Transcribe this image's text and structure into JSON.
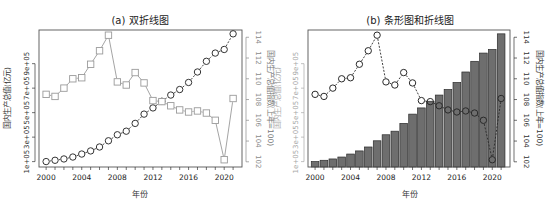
{
  "figure": {
    "width": 552,
    "height": 211,
    "background": "#ffffff"
  },
  "chart_data": [
    {
      "id": "a",
      "type": "line",
      "title": "(a) 双折线图",
      "xlabel": "年份",
      "ylabel_left": "国内生产总值(亿元)",
      "ylabel_right": "国内生产总值指数(上年=100)",
      "x": [
        2000,
        2001,
        2002,
        2003,
        2004,
        2005,
        2006,
        2007,
        2008,
        2009,
        2010,
        2011,
        2012,
        2013,
        2014,
        2015,
        2016,
        2017,
        2018,
        2019,
        2020,
        2021
      ],
      "x_ticks": [
        2000,
        2004,
        2008,
        2012,
        2016,
        2020
      ],
      "xlim": [
        1999.2,
        2022.0
      ],
      "y_left_ticks": [
        100000,
        300000,
        500000,
        700000,
        900000
      ],
      "y_left_tick_labels": [
        "1e+05",
        "3e+05",
        "5e+05",
        "7e+05",
        "9e+05"
      ],
      "y_left_lim": [
        56000,
        1175000
      ],
      "y_right_ticks": [
        102,
        104,
        106,
        108,
        110,
        112,
        114
      ],
      "y_right_lim": [
        101.5,
        114.7
      ],
      "grid": false,
      "series": [
        {
          "name": "国内生产总值(亿元)",
          "axis": "left",
          "marker": "circle",
          "line": "dashed",
          "color": "#333333",
          "values": [
            100280,
            110863,
            121717,
            137422,
            161840,
            187319,
            219438,
            270092,
            319245,
            348518,
            412119,
            487940,
            538580,
            592963,
            643563,
            688858,
            746395,
            832036,
            919281,
            986515,
            1015986,
            1143670
          ]
        },
        {
          "name": "国内生产总值指数(上年=100)",
          "axis": "right",
          "marker": "square",
          "line": "solid",
          "color": "#9a9a9a",
          "values": [
            108.5,
            108.3,
            109.1,
            110.0,
            110.1,
            111.4,
            112.7,
            114.2,
            109.7,
            109.4,
            110.6,
            109.6,
            107.9,
            107.8,
            107.4,
            107.0,
            106.8,
            106.9,
            106.7,
            106.0,
            102.2,
            108.1
          ]
        }
      ],
      "colors": {
        "left_axis": "#333333",
        "right_axis": "#8a8a8a",
        "frame": "#555555"
      }
    },
    {
      "id": "b",
      "type": "bar",
      "title": "(b) 条形图和折线图",
      "xlabel": "年份",
      "ylabel_left": "国内生产总值(亿元)",
      "ylabel_right": "国内生产总值指数(上年=100)",
      "x": [
        2000,
        2001,
        2002,
        2003,
        2004,
        2005,
        2006,
        2007,
        2008,
        2009,
        2010,
        2011,
        2012,
        2013,
        2014,
        2015,
        2016,
        2017,
        2018,
        2019,
        2020,
        2021
      ],
      "x_ticks": [
        2000,
        2004,
        2008,
        2012,
        2016,
        2020
      ],
      "xlim": [
        1999.2,
        2022.0
      ],
      "y_left_ticks": [
        100000,
        300000,
        500000,
        700000,
        900000
      ],
      "y_left_tick_labels": [
        "1e+05",
        "3e+05",
        "5e+05",
        "7e+05",
        "9e+05"
      ],
      "y_left_lim": [
        56000,
        1175000
      ],
      "y_right_ticks": [
        102,
        104,
        106,
        108,
        110,
        112,
        114
      ],
      "y_right_lim": [
        101.5,
        114.7
      ],
      "grid": false,
      "series": [
        {
          "name": "国内生产总值(亿元)",
          "axis": "left",
          "kind": "bar",
          "color": "#6e6e6e",
          "values": [
            100280,
            110863,
            121717,
            137422,
            161840,
            187319,
            219438,
            270092,
            319245,
            348518,
            412119,
            487940,
            538580,
            592963,
            643563,
            688858,
            746395,
            832036,
            919281,
            986515,
            1015986,
            1143670
          ]
        },
        {
          "name": "国内生产总值指数(上年=100)",
          "axis": "right",
          "kind": "line",
          "marker": "circle",
          "line": "dashed",
          "color": "#2a2a2a",
          "values": [
            108.5,
            108.3,
            109.1,
            110.0,
            110.1,
            111.4,
            112.7,
            114.2,
            109.7,
            109.4,
            110.6,
            109.6,
            107.9,
            107.8,
            107.4,
            107.0,
            106.8,
            106.9,
            106.7,
            106.0,
            102.2,
            108.1
          ]
        }
      ],
      "colors": {
        "left_axis": "#a8a8a8",
        "right_axis": "#333333",
        "frame": "#555555"
      }
    }
  ],
  "panels": [
    {
      "id": "a",
      "frame": {
        "x0": 39,
        "x1": 242,
        "y0": 30,
        "y1": 167
      }
    },
    {
      "id": "b",
      "frame": {
        "x0": 308,
        "x1": 510,
        "y0": 30,
        "y1": 167
      }
    }
  ]
}
